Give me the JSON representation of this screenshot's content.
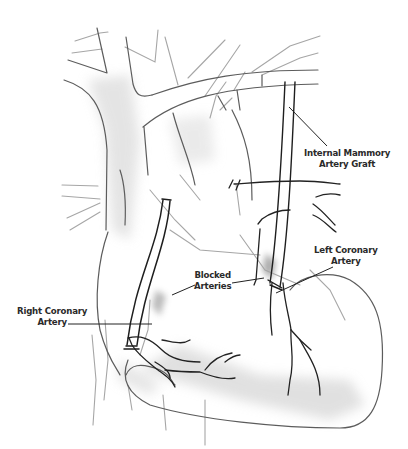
{
  "figure": {
    "colors": {
      "line": "#555555",
      "dark_line": "#1e1e1e",
      "light_line": "#9a9a9a",
      "shade": "#d8d8d8",
      "label": "#2a2a2a"
    }
  },
  "labels": {
    "internal_mammary": {
      "line1": "Internal Mammory",
      "line2": "Artery Graft"
    },
    "left_coronary": {
      "line1": "Left Coronary",
      "line2": "Artery"
    },
    "blocked": {
      "line1": "Blocked",
      "line2": "Arteries"
    },
    "right_coronary": {
      "line1": "Right Coronary",
      "line2": "Artery"
    }
  }
}
